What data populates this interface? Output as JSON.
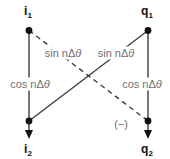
{
  "nodes": {
    "i1": {
      "base": "i",
      "sub": "1"
    },
    "q1": {
      "base": "q",
      "sub": "1"
    },
    "i2": {
      "base": "i",
      "sub": "2"
    },
    "q2": {
      "base": "q",
      "sub": "2"
    }
  },
  "edge_labels": {
    "sin_left": {
      "text": "sin nΔ",
      "theta": "θ"
    },
    "sin_right": {
      "text": "sin nΔ",
      "theta": "θ"
    },
    "cos_left": {
      "text": "cos nΔ",
      "theta": "θ"
    },
    "cos_right": {
      "text": "cos nΔ",
      "theta": "θ"
    },
    "negate": "(−)"
  },
  "colors": {
    "line": "#3d3d3d",
    "node": "#111111",
    "label_text": "#6f6f6f",
    "node_label": "#111111",
    "background": "#ffffff"
  }
}
